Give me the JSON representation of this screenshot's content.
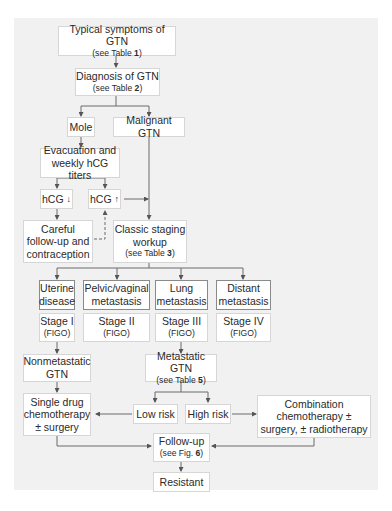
{
  "nodes": {
    "symptoms": {
      "title": "Typical symptoms of GTN",
      "ref_prefix": "(see Table ",
      "ref_num": "1",
      "ref_suffix": ")"
    },
    "diagnosis": {
      "title": "Diagnosis of GTN",
      "ref_prefix": "(see Table ",
      "ref_num": "2",
      "ref_suffix": ")"
    },
    "mole": {
      "title": "Mole"
    },
    "malignant": {
      "title": "Malignant GTN"
    },
    "evacuation": {
      "line1": "Evacuation and",
      "line2": "weekly hCG titers"
    },
    "hcg_down": {
      "title": "hCG",
      "arrow": "↓"
    },
    "hcg_up": {
      "title": "hCG",
      "arrow": "↑"
    },
    "careful": {
      "line1": "Careful",
      "line2": "follow-up and",
      "line3": "contraception"
    },
    "staging": {
      "line1": "Classic staging",
      "line2": "workup",
      "ref_prefix": "(see Table ",
      "ref_num": "3",
      "ref_suffix": ")"
    },
    "uterine": {
      "line1": "Uterine",
      "line2": "disease"
    },
    "pelvic": {
      "line1": "Pelvic/vaginal",
      "line2": "metastasis"
    },
    "lung": {
      "line1": "Lung",
      "line2": "metastasis"
    },
    "distant": {
      "line1": "Distant",
      "line2": "metastasis"
    },
    "stage1": {
      "title": "Stage I",
      "sub": "(FIGO)"
    },
    "stage2": {
      "title": "Stage II",
      "sub": "(FIGO)"
    },
    "stage3": {
      "title": "Stage III",
      "sub": "(FIGO)"
    },
    "stage4": {
      "title": "Stage IV",
      "sub": "(FIGO)"
    },
    "nonmetastatic": {
      "line1": "Nonmetastatic",
      "line2": "GTN"
    },
    "metastatic": {
      "title": "Metastatic GTN",
      "ref_prefix": "(see Table ",
      "ref_num": "5",
      "ref_suffix": ")"
    },
    "single_drug": {
      "line1": "Single drug",
      "line2": "chemotherapy",
      "line3": "± surgery"
    },
    "low_risk": {
      "title": "Low risk"
    },
    "high_risk": {
      "title": "High risk"
    },
    "combination": {
      "line1": "Combination",
      "line2": "chemotherapy ±",
      "line3": "surgery, ± radiotherapy"
    },
    "followup": {
      "title": "Follow-up",
      "ref_prefix": "(see Fig. ",
      "ref_num": "6",
      "ref_suffix": ")"
    },
    "resistant": {
      "title": "Resistant"
    }
  },
  "colors": {
    "panel": "#f1f1f1",
    "box": "#ffffff",
    "line": "#6b6b6b",
    "box_border": "#d6d6d6",
    "dark_border": "#8a8a8a"
  }
}
